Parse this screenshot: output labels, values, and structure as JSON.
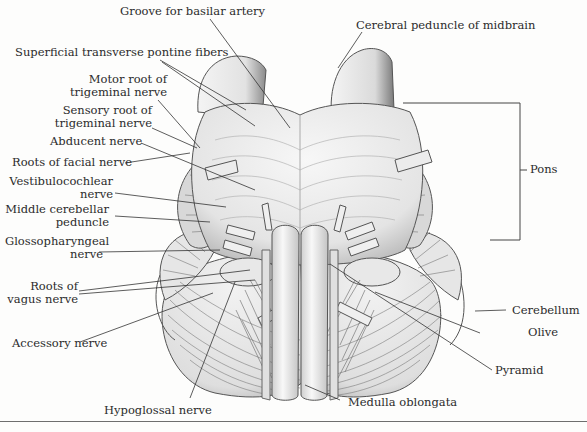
{
  "figure": {
    "colors": {
      "background": "#fdfdfc",
      "ink": "#2b2b2b",
      "shading": "#bdbdbd"
    },
    "labels": {
      "groove_basilar": "Groove for basilar artery",
      "cerebral_peduncle": "Cerebral peduncle of midbrain",
      "superficial_fibers": "Superficial transverse pontine fibers",
      "motor_root_1": "Motor root of",
      "motor_root_2": "trigeminal nerve",
      "sensory_root_1": "Sensory root of",
      "sensory_root_2": "trigeminal nerve",
      "abducent": "Abducent nerve",
      "facial": "Roots of facial nerve",
      "vestibulo_1": "Vestibulocochlear",
      "vestibulo_2": "nerve",
      "middle_cerebellar_1": "Middle cerebellar",
      "middle_cerebellar_2": "peduncle",
      "glosso_1": "Glossopharyngeal",
      "glosso_2": "nerve",
      "vagus_1": "Roots of",
      "vagus_2": "vagus nerve",
      "accessory": "Accessory nerve",
      "hypoglossal": "Hypoglossal nerve",
      "medulla": "Medulla oblongata",
      "pyramid": "Pyramid",
      "olive": "Olive",
      "cerebellum": "Cerebellum",
      "pons": "Pons"
    }
  }
}
